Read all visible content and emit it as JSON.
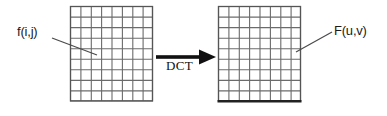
{
  "figure": {
    "background_color": "#ffffff",
    "width": 387,
    "height": 116
  },
  "labels": {
    "spatial_domain": "f(i,j)",
    "frequency_domain": "F(u,v)",
    "transform": "DCT"
  },
  "grids": {
    "left": {
      "name": "spatial-domain-grid",
      "columns": 8,
      "rows": 9,
      "x": 70,
      "y": 6,
      "width": 83,
      "height": 95,
      "line_color": "#6b6b6b",
      "border_color": "#555555",
      "fill_color": "#ffffff"
    },
    "right": {
      "name": "frequency-domain-grid",
      "columns": 8,
      "rows": 9,
      "x": 218,
      "y": 6,
      "width": 83,
      "height": 95,
      "line_color": "#6b6b6b",
      "border_color": "#555555",
      "fill_color": "#ffffff",
      "bottom_border_color": "#222222"
    }
  },
  "arrow": {
    "name": "dct-arrow",
    "from_x": 156,
    "to_x": 216,
    "y": 57,
    "shaft_thickness": 4,
    "head_width": 17,
    "head_height": 15,
    "color": "#111111"
  },
  "leaders": [
    {
      "name": "leader-line-fij",
      "x1": 52,
      "y1": 38,
      "x2": 97,
      "y2": 55,
      "color": "#4a4a4a"
    },
    {
      "name": "leader-line-Fuv",
      "x1": 332,
      "y1": 32,
      "x2": 296,
      "y2": 52,
      "color": "#4a4a4a"
    }
  ],
  "colors": {
    "grid_line": "#6b6b6b",
    "grid_border": "#555555",
    "text": "#1a1a1a",
    "arrow": "#111111"
  }
}
